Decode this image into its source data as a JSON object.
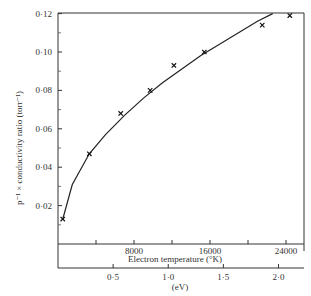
{
  "chart_data": {
    "type": "scatter",
    "title": "",
    "ylabel": "p⁻¹ × conductivity ratio (torr⁻¹)",
    "xlabel": "Electron temperature (°K)",
    "x2label": "(eV)",
    "ylim": [
      0,
      0.12
    ],
    "xlim": [
      0,
      25500
    ],
    "yticks": [
      "0·02",
      "0·04",
      "0·06",
      "0·08",
      "0·10",
      "0·12"
    ],
    "ytick_values": [
      0.02,
      0.04,
      0.06,
      0.08,
      0.1,
      0.12
    ],
    "xticks": [
      "8000",
      "16000",
      "24000"
    ],
    "xtick_values": [
      8000,
      16000,
      24000
    ],
    "x2ticks": [
      "0·5",
      "1·0",
      "1·5",
      "2·0"
    ],
    "x2tick_values": [
      0.5,
      1.0,
      1.5,
      2.0
    ],
    "grid": false,
    "legend": null,
    "series": [
      {
        "name": "measured",
        "marker": "x",
        "x": [
          500,
          3300,
          6600,
          9700,
          12200,
          15400,
          21500,
          24400
        ],
        "y": [
          0.013,
          0.047,
          0.068,
          0.08,
          0.093,
          0.1,
          0.114,
          0.119
        ]
      },
      {
        "name": "fitted curve",
        "style": "line",
        "x": [
          500,
          1500,
          3300,
          5000,
          7000,
          9000,
          11000,
          13000,
          15000,
          17000,
          19000,
          21000,
          22600
        ],
        "y": [
          0.013,
          0.031,
          0.047,
          0.057,
          0.067,
          0.076,
          0.084,
          0.091,
          0.098,
          0.104,
          0.11,
          0.116,
          0.12
        ]
      }
    ]
  }
}
